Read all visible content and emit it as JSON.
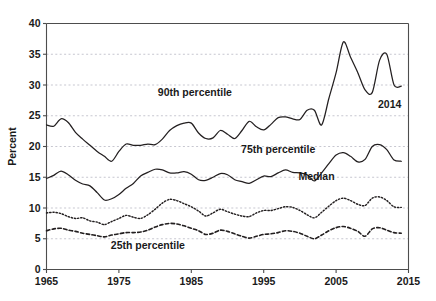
{
  "chart_data": {
    "type": "line",
    "title": "",
    "subtitle": "",
    "xlabel": "",
    "ylabel": "Percent",
    "xlim": [
      1965,
      2015
    ],
    "ylim": [
      0,
      40
    ],
    "xticks": [
      1965,
      1975,
      1985,
      1995,
      2005,
      2015
    ],
    "yticks": [
      0,
      5,
      10,
      15,
      20,
      25,
      30,
      35,
      40
    ],
    "grid": "horizontal-dashed",
    "legend_position": "inline-annotations",
    "annotations": [
      {
        "text": "90th percentile",
        "x": 1985.5,
        "y": 28.2
      },
      {
        "text": "75th percentile",
        "x": 1997.0,
        "y": 19.0
      },
      {
        "text": "Median",
        "x": 2002.3,
        "y": 14.6
      },
      {
        "text": "25th percentile",
        "x": 1979.0,
        "y": 3.3
      },
      {
        "text": "2014",
        "x": 2012.4,
        "y": 26.3
      }
    ],
    "x": [
      1965,
      1966,
      1967,
      1968,
      1969,
      1970,
      1971,
      1972,
      1973,
      1974,
      1975,
      1976,
      1977,
      1978,
      1979,
      1980,
      1981,
      1982,
      1983,
      1984,
      1985,
      1986,
      1987,
      1988,
      1989,
      1990,
      1991,
      1992,
      1993,
      1994,
      1995,
      1996,
      1997,
      1998,
      1999,
      2000,
      2001,
      2002,
      2003,
      2004,
      2005,
      2006,
      2007,
      2008,
      2009,
      2010,
      2011,
      2012,
      2013,
      2014
    ],
    "series": [
      {
        "name": "90th percentile",
        "style": "solid",
        "values": [
          23.5,
          23.3,
          24.5,
          23.9,
          22.3,
          21.2,
          20.2,
          19.2,
          18.4,
          17.6,
          19.2,
          20.4,
          20.2,
          20.2,
          20.4,
          20.3,
          21.2,
          22.6,
          23.4,
          23.8,
          23.8,
          22.2,
          21.3,
          21.4,
          22.6,
          22.0,
          21.3,
          22.6,
          24.1,
          23.2,
          22.7,
          23.6,
          24.7,
          24.8,
          24.5,
          24.4,
          25.9,
          25.9,
          23.5,
          27.8,
          32.0,
          37.0,
          34.5,
          32.0,
          29.2,
          28.8,
          34.0,
          35.0,
          30.0,
          29.8
        ]
      },
      {
        "name": "75th percentile",
        "style": "solid",
        "values": [
          14.8,
          15.3,
          16.0,
          15.4,
          14.5,
          13.9,
          13.6,
          12.5,
          11.3,
          11.5,
          12.2,
          13.2,
          14.0,
          15.2,
          15.8,
          16.3,
          16.2,
          15.7,
          15.7,
          15.9,
          15.5,
          14.6,
          14.5,
          15.0,
          15.6,
          15.4,
          14.6,
          14.3,
          14.0,
          14.6,
          15.2,
          15.1,
          15.7,
          16.2,
          15.8,
          15.7,
          15.4,
          14.4,
          15.7,
          17.2,
          18.6,
          19.0,
          18.4,
          17.5,
          17.9,
          20.0,
          20.3,
          19.5,
          17.8,
          17.6
        ]
      },
      {
        "name": "Median",
        "style": "dotted",
        "values": [
          9.2,
          9.3,
          9.1,
          8.6,
          8.3,
          8.4,
          7.9,
          7.7,
          7.3,
          7.8,
          8.3,
          8.8,
          8.5,
          8.3,
          8.9,
          9.8,
          10.8,
          11.4,
          11.2,
          10.7,
          10.2,
          9.5,
          8.7,
          9.2,
          9.8,
          9.4,
          9.0,
          8.7,
          8.6,
          9.2,
          9.6,
          9.6,
          9.9,
          10.2,
          10.1,
          9.6,
          8.9,
          8.4,
          9.3,
          10.3,
          11.2,
          11.6,
          11.2,
          10.6,
          10.4,
          11.6,
          11.8,
          11.2,
          10.2,
          10.1
        ]
      },
      {
        "name": "25th percentile",
        "style": "dashed",
        "values": [
          6.3,
          6.6,
          6.7,
          6.4,
          6.2,
          5.9,
          5.7,
          5.5,
          5.3,
          5.6,
          5.8,
          6.0,
          6.0,
          6.1,
          6.4,
          6.9,
          7.3,
          7.5,
          7.4,
          7.1,
          6.7,
          6.3,
          5.7,
          5.9,
          6.4,
          6.2,
          5.8,
          5.4,
          5.1,
          5.4,
          5.7,
          5.8,
          6.0,
          6.3,
          6.2,
          5.9,
          5.4,
          5.0,
          5.6,
          6.3,
          6.8,
          7.0,
          6.7,
          6.2,
          5.4,
          6.6,
          6.8,
          6.4,
          6.0,
          5.9
        ]
      }
    ]
  }
}
